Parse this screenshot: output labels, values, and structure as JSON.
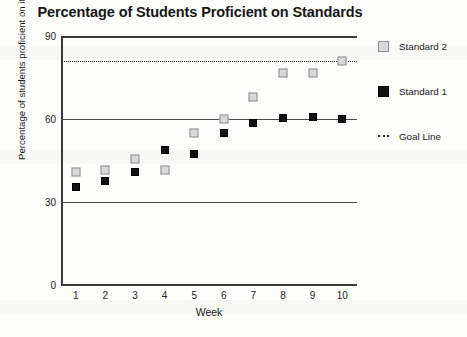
{
  "chart_data": {
    "type": "scatter",
    "title": "Percentage of Students Proficient on Standards",
    "xlabel": "Week",
    "ylabel": "Percentage of students proficient on item",
    "categories": [
      "1",
      "2",
      "3",
      "4",
      "5",
      "6",
      "7",
      "8",
      "9",
      "10"
    ],
    "x": [
      1,
      2,
      3,
      4,
      5,
      6,
      7,
      8,
      9,
      10
    ],
    "xlim": [
      0.5,
      10.5
    ],
    "ylim": [
      0,
      90
    ],
    "yticks": [
      "0",
      "30",
      "60",
      "90"
    ],
    "ytick_values": [
      0,
      30,
      60,
      90
    ],
    "grid": false,
    "legend_position": "right",
    "series": [
      {
        "name": "Standard 2",
        "marker": "open-square",
        "color": "#d9d9d9",
        "values": [
          41,
          41.5,
          45.5,
          41.5,
          55,
          60,
          68,
          76.5,
          76.5,
          81
        ]
      },
      {
        "name": "Standard 1",
        "marker": "filled-square",
        "color": "#111111",
        "values": [
          35.4,
          37.5,
          40.7,
          48.8,
          47.5,
          55,
          58.5,
          60.2,
          60.7,
          60
        ]
      }
    ],
    "reference_lines": [
      {
        "name": "Goal Line",
        "value": 81,
        "style": "dotted",
        "color": "#2b2b2b"
      },
      {
        "name": "upper-solid-line",
        "value": 60,
        "style": "solid",
        "color": "#4a4a4a"
      },
      {
        "name": "lower-solid-line",
        "value": 30,
        "style": "solid",
        "color": "#4a4a4a"
      }
    ]
  },
  "legend": {
    "entries": [
      {
        "label": "Standard 2"
      },
      {
        "label": "Standard 1"
      },
      {
        "label": "Goal Line"
      }
    ]
  }
}
